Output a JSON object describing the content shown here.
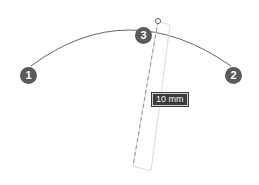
{
  "diagram": {
    "points": [
      {
        "id": "1",
        "label": "1",
        "x": 28,
        "y": 75
      },
      {
        "id": "2",
        "label": "2",
        "x": 233,
        "y": 75
      },
      {
        "id": "3",
        "label": "3",
        "x": 143,
        "y": 35
      }
    ],
    "arc": {
      "start": [
        31,
        66
      ],
      "control": [
        130,
        4
      ],
      "end": [
        231,
        66
      ],
      "color": "#555555"
    },
    "handle": {
      "x": 158,
      "y": 21
    },
    "dimension": {
      "label": "10 mm"
    },
    "colors": {
      "badge": "#5a5a5a",
      "arc": "#555555",
      "guide": "#cfcfcf",
      "dashed": "#888888",
      "label_bg": "#3c3c3c"
    }
  }
}
